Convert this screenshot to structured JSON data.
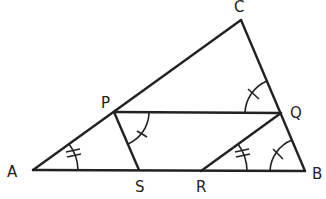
{
  "diagram": {
    "type": "geometry-triangle",
    "points": {
      "A": {
        "label": "A",
        "x": 33,
        "y": 170
      },
      "B": {
        "label": "B",
        "x": 305,
        "y": 171
      },
      "C": {
        "label": "C",
        "x": 241,
        "y": 20
      },
      "P": {
        "label": "P",
        "x": 114,
        "y": 112
      },
      "Q": {
        "label": "Q",
        "x": 281,
        "y": 113
      },
      "S": {
        "label": "S",
        "x": 139,
        "y": 170
      },
      "R": {
        "label": "R",
        "x": 201,
        "y": 171
      }
    },
    "segments": [
      "AB",
      "AC",
      "CB",
      "PQ",
      "PS",
      "QR"
    ],
    "angle_marks": [
      {
        "at": "A",
        "between": "AB-AC",
        "ticks": 2
      },
      {
        "at": "R",
        "between": "RB-RQ",
        "ticks": 2
      },
      {
        "at": "P",
        "between": "PQ-PS",
        "ticks": 1
      },
      {
        "at": "Q",
        "between": "QP-QC",
        "ticks": 1
      },
      {
        "at": "B",
        "between": "BA-BQ",
        "ticks": 1
      }
    ],
    "colors": {
      "stroke": "#222222",
      "background": "#ffffff"
    }
  }
}
